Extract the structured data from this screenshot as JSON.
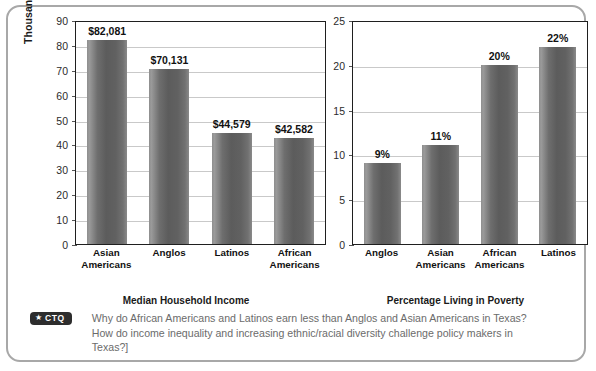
{
  "chart_data": [
    {
      "type": "bar",
      "title": "",
      "xlabel": "Median Household Income",
      "ylabel": "Thousands of 2016 Dollars",
      "categories": [
        "Asian Americans",
        "Anglos",
        "Latinos",
        "African Americans"
      ],
      "values": [
        82.081,
        70.131,
        44.579,
        42.582
      ],
      "data_labels": [
        "$82,081",
        "$70,131",
        "$44,579",
        "$42,582"
      ],
      "ylim": [
        0,
        90
      ],
      "yticks": [
        0,
        10,
        20,
        30,
        40,
        50,
        60,
        70,
        80,
        90
      ],
      "ytick_labels": [
        "0",
        "10",
        "20",
        "30",
        "40",
        "50",
        "60",
        "70",
        "80",
        "90"
      ],
      "grid": true,
      "legend": "none"
    },
    {
      "type": "bar",
      "title": "",
      "xlabel": "Percentage Living in Poverty",
      "ylabel": "",
      "categories": [
        "Anglos",
        "Asian Americans",
        "African Americans",
        "Latinos"
      ],
      "values": [
        9,
        11,
        20,
        22
      ],
      "data_labels": [
        "9%",
        "11%",
        "20%",
        "22%"
      ],
      "ylim": [
        0,
        25
      ],
      "yticks": [
        0,
        5,
        10,
        15,
        20,
        25
      ],
      "ytick_labels": [
        "0",
        "5",
        "10",
        "15",
        "20",
        "25"
      ],
      "grid": true,
      "legend": "none"
    }
  ],
  "left_chart": {
    "y_axis_title": "Thousands of 2016 Dollars",
    "x_axis_title": "Median Household Income",
    "ticks": [
      "90",
      "80",
      "70",
      "60",
      "50",
      "40",
      "30",
      "20",
      "10",
      "0"
    ],
    "bars": [
      {
        "label_line1": "Asian",
        "label_line2": "Americans",
        "value_label": "$82,081",
        "value": 82.081
      },
      {
        "label_line1": "Anglos",
        "label_line2": "",
        "value_label": "$70,131",
        "value": 70.131
      },
      {
        "label_line1": "Latinos",
        "label_line2": "",
        "value_label": "$44,579",
        "value": 44.579
      },
      {
        "label_line1": "African",
        "label_line2": "Americans",
        "value_label": "$42,582",
        "value": 42.582
      }
    ]
  },
  "right_chart": {
    "y_axis_title": "",
    "x_axis_title": "Percentage Living in Poverty",
    "ticks": [
      "25",
      "20",
      "15",
      "10",
      "5",
      "0"
    ],
    "bars": [
      {
        "label_line1": "Anglos",
        "label_line2": "",
        "value_label": "9%",
        "value": 9
      },
      {
        "label_line1": "Asian",
        "label_line2": "Americans",
        "value_label": "11%",
        "value": 11
      },
      {
        "label_line1": "African",
        "label_line2": "Americans",
        "value_label": "20%",
        "value": 20
      },
      {
        "label_line1": "Latinos",
        "label_line2": "",
        "value_label": "22%",
        "value": 22
      }
    ]
  },
  "ctq": {
    "badge_star": "★",
    "badge_label": "CTQ",
    "caption": "Why do African Americans and Latinos earn less than Anglos and Asian Americans in Texas? How do income inequality and increasing ethnic/racial diversity challenge policy makers in Texas?]"
  },
  "colors": {
    "bar_fill": "#6b6b6b",
    "frame_border": "#a8a8a8",
    "plot_border": "#1f1f1f",
    "gridline": "#c9c9c9",
    "caption_text": "#6b6b6b",
    "badge_bg": "#2d2d2d"
  }
}
